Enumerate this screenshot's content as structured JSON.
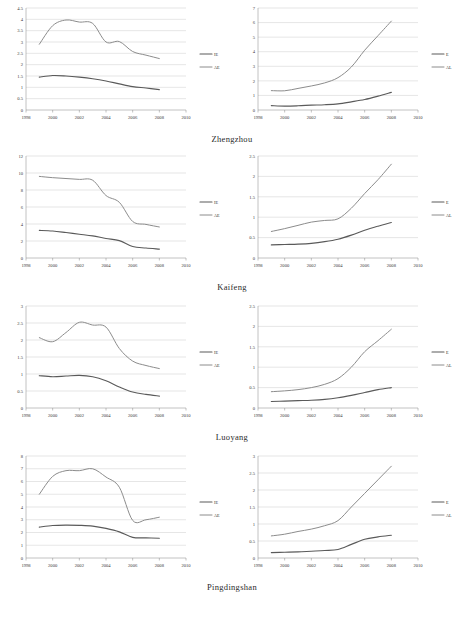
{
  "figure": {
    "rows": [
      {
        "caption": "Zhengzhou",
        "left": {
          "chart_data": {
            "type": "line",
            "title": "",
            "xlabel": "",
            "ylabel": "",
            "xlim": [
              1998,
              2010
            ],
            "ylim": [
              0,
              4.5
            ],
            "ystep": 0.5,
            "grid": true,
            "legend_position": "right",
            "xticks": [
              "1998",
              "2000",
              "2002",
              "2004",
              "2006",
              "2008",
              "2010"
            ],
            "yticks": [
              "0",
              "0.5",
              "1",
              "1.5",
              "2",
              "2.5",
              "3",
              "3.5",
              "4",
              "4.5"
            ],
            "x": [
              1999,
              2000,
              2001,
              2002,
              2003,
              2004,
              2005,
              2006,
              2007,
              2008
            ],
            "series": [
              {
                "name": "IE",
                "values": [
                  1.45,
                  1.52,
                  1.5,
                  1.45,
                  1.38,
                  1.28,
                  1.15,
                  1.03,
                  0.97,
                  0.9
                ]
              },
              {
                "name": "AE",
                "values": [
                  2.9,
                  3.72,
                  3.97,
                  3.88,
                  3.82,
                  3.0,
                  3.02,
                  2.58,
                  2.42,
                  2.27
                ]
              }
            ]
          }
        },
        "right": {
          "chart_data": {
            "type": "line",
            "title": "",
            "xlabel": "",
            "ylabel": "",
            "xlim": [
              1998,
              2010
            ],
            "ylim": [
              0,
              7
            ],
            "ystep": 1,
            "grid": true,
            "legend_position": "right",
            "xticks": [
              "1998",
              "2000",
              "2002",
              "2004",
              "2006",
              "2008",
              "2010"
            ],
            "yticks": [
              "0",
              "1",
              "2",
              "3",
              "4",
              "5",
              "6",
              "7"
            ],
            "x": [
              1999,
              2000,
              2001,
              2002,
              2003,
              2004,
              2005,
              2006,
              2007,
              2008
            ],
            "series": [
              {
                "name": "E",
                "values": [
                  0.3,
                  0.27,
                  0.29,
                  0.33,
                  0.36,
                  0.42,
                  0.56,
                  0.72,
                  0.95,
                  1.21
                ]
              },
              {
                "name": "AL",
                "values": [
                  1.33,
                  1.32,
                  1.48,
                  1.65,
                  1.86,
                  2.22,
                  2.95,
                  4.1,
                  5.1,
                  6.1
                ]
              }
            ]
          }
        }
      },
      {
        "caption": "Kaifeng",
        "left": {
          "chart_data": {
            "type": "line",
            "title": "",
            "xlabel": "",
            "ylabel": "",
            "xlim": [
              1998,
              2010
            ],
            "ylim": [
              0,
              12
            ],
            "ystep": 2,
            "grid": true,
            "legend_position": "right",
            "xticks": [
              "1998",
              "2000",
              "2002",
              "2004",
              "2006",
              "2008",
              "2010"
            ],
            "yticks": [
              "0",
              "2",
              "4",
              "6",
              "8",
              "10",
              "12"
            ],
            "x": [
              1999,
              2000,
              2001,
              2002,
              2003,
              2004,
              2005,
              2006,
              2007,
              2008
            ],
            "series": [
              {
                "name": "IE",
                "values": [
                  3.25,
                  3.18,
                  3.0,
                  2.8,
                  2.6,
                  2.3,
                  2.05,
                  1.35,
                  1.18,
                  1.05
                ]
              },
              {
                "name": "AE",
                "values": [
                  9.6,
                  9.45,
                  9.35,
                  9.25,
                  9.15,
                  7.35,
                  6.55,
                  4.3,
                  3.95,
                  3.65
                ]
              }
            ]
          }
        },
        "right": {
          "chart_data": {
            "type": "line",
            "title": "",
            "xlabel": "",
            "ylabel": "",
            "xlim": [
              1998,
              2010
            ],
            "ylim": [
              0,
              2.5
            ],
            "ystep": 0.5,
            "grid": true,
            "legend_position": "right",
            "xticks": [
              "1998",
              "2000",
              "2002",
              "2004",
              "2006",
              "2008",
              "2010"
            ],
            "yticks": [
              "0",
              "0.5",
              "1",
              "1.5",
              "2",
              "2.5"
            ],
            "x": [
              1999,
              2000,
              2001,
              2002,
              2003,
              2004,
              2005,
              2006,
              2007,
              2008
            ],
            "series": [
              {
                "name": "E",
                "values": [
                  0.32,
                  0.33,
                  0.34,
                  0.36,
                  0.4,
                  0.46,
                  0.56,
                  0.68,
                  0.78,
                  0.87
                ]
              },
              {
                "name": "AL",
                "values": [
                  0.65,
                  0.72,
                  0.8,
                  0.88,
                  0.92,
                  0.96,
                  1.22,
                  1.58,
                  1.92,
                  2.3
                ]
              }
            ]
          }
        }
      },
      {
        "caption": "Luoyang",
        "left": {
          "chart_data": {
            "type": "line",
            "title": "",
            "xlabel": "",
            "ylabel": "",
            "xlim": [
              1998,
              2010
            ],
            "ylim": [
              0,
              3
            ],
            "ystep": 0.5,
            "grid": true,
            "legend_position": "right",
            "xticks": [
              "1998",
              "2000",
              "2002",
              "2004",
              "2006",
              "2008",
              "2010"
            ],
            "yticks": [
              "0",
              "0.5",
              "1",
              "1.5",
              "2",
              "2.5",
              "3"
            ],
            "x": [
              1999,
              2000,
              2001,
              2002,
              2003,
              2004,
              2005,
              2006,
              2007,
              2008
            ],
            "series": [
              {
                "name": "IE",
                "values": [
                  0.95,
                  0.92,
                  0.94,
                  0.96,
                  0.92,
                  0.8,
                  0.62,
                  0.47,
                  0.4,
                  0.35
                ]
              },
              {
                "name": "AE",
                "values": [
                  2.07,
                  1.95,
                  2.22,
                  2.52,
                  2.44,
                  2.38,
                  1.75,
                  1.38,
                  1.25,
                  1.16
                ]
              }
            ]
          }
        },
        "right": {
          "chart_data": {
            "type": "line",
            "title": "",
            "xlabel": "",
            "ylabel": "",
            "xlim": [
              1998,
              2010
            ],
            "ylim": [
              0,
              2.5
            ],
            "ystep": 0.5,
            "grid": true,
            "legend_position": "right",
            "xticks": [
              "1998",
              "2000",
              "2002",
              "2004",
              "2006",
              "2008",
              "2010"
            ],
            "yticks": [
              "0",
              "0.5",
              "1",
              "1.5",
              "2",
              "2.5"
            ],
            "x": [
              1999,
              2000,
              2001,
              2002,
              2003,
              2004,
              2005,
              2006,
              2007,
              2008
            ],
            "series": [
              {
                "name": "E",
                "values": [
                  0.16,
                  0.17,
                  0.18,
                  0.19,
                  0.21,
                  0.25,
                  0.31,
                  0.38,
                  0.45,
                  0.5
                ]
              },
              {
                "name": "AL",
                "values": [
                  0.4,
                  0.42,
                  0.45,
                  0.5,
                  0.58,
                  0.72,
                  1.0,
                  1.38,
                  1.65,
                  1.93
                ]
              }
            ]
          }
        }
      },
      {
        "caption": "Pingdingshan",
        "left": {
          "chart_data": {
            "type": "line",
            "title": "",
            "xlabel": "",
            "ylabel": "",
            "xlim": [
              1998,
              2010
            ],
            "ylim": [
              0,
              8
            ],
            "ystep": 1,
            "grid": true,
            "legend_position": "right",
            "xticks": [
              "1998",
              "2000",
              "2002",
              "2004",
              "2006",
              "2008",
              "2010"
            ],
            "yticks": [
              "0",
              "1",
              "2",
              "3",
              "4",
              "5",
              "6",
              "7",
              "8"
            ],
            "x": [
              1999,
              2000,
              2001,
              2002,
              2003,
              2004,
              2005,
              2006,
              2007,
              2008
            ],
            "series": [
              {
                "name": "IE",
                "values": [
                  2.42,
                  2.55,
                  2.58,
                  2.56,
                  2.5,
                  2.32,
                  2.05,
                  1.62,
                  1.58,
                  1.55
                ]
              },
              {
                "name": "AE",
                "values": [
                  5.0,
                  6.4,
                  6.85,
                  6.85,
                  7.0,
                  6.35,
                  5.55,
                  2.95,
                  3.0,
                  3.2
                ]
              }
            ]
          }
        },
        "right": {
          "chart_data": {
            "type": "line",
            "title": "",
            "xlabel": "",
            "ylabel": "",
            "xlim": [
              1998,
              2010
            ],
            "ylim": [
              0,
              3
            ],
            "ystep": 0.5,
            "grid": true,
            "legend_position": "right",
            "xticks": [
              "1998",
              "2000",
              "2002",
              "2004",
              "2006",
              "2008",
              "2010"
            ],
            "yticks": [
              "0",
              "0.5",
              "1",
              "1.5",
              "2",
              "2.5",
              "3"
            ],
            "x": [
              1999,
              2000,
              2001,
              2002,
              2003,
              2004,
              2005,
              2006,
              2007,
              2008
            ],
            "series": [
              {
                "name": "E",
                "values": [
                  0.16,
                  0.17,
                  0.18,
                  0.2,
                  0.22,
                  0.25,
                  0.4,
                  0.55,
                  0.62,
                  0.67
                ]
              },
              {
                "name": "AL",
                "values": [
                  0.65,
                  0.7,
                  0.78,
                  0.85,
                  0.95,
                  1.1,
                  1.5,
                  1.9,
                  2.3,
                  2.7
                ]
              }
            ]
          }
        }
      }
    ]
  },
  "style": {
    "series1_color": "#5a5a5a",
    "series2_color": "#8c8c8c",
    "grid_color": "#c8c8c8",
    "axis_color": "#8f8f8f",
    "background": "#ffffff"
  }
}
